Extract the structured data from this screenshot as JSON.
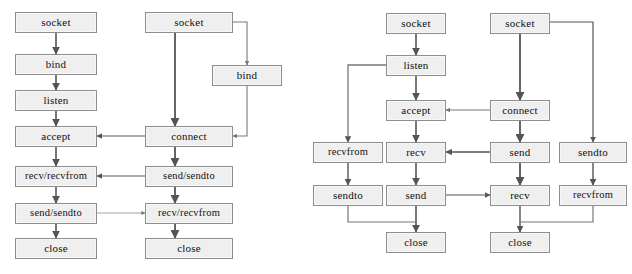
{
  "figure": {
    "style": {
      "node_fill": "#efefef",
      "node_border": "#8d8d8d",
      "edge_color": "#555555",
      "text_color": "#111111",
      "background": "#ffffff"
    }
  },
  "diagrams": [
    {
      "id": "tcp-stream-sockets",
      "name": "tcp-connection-oriented-diagram",
      "columns": [
        {
          "role": "server",
          "labels": [
            "socket",
            "bind",
            "listen",
            "accept",
            "recv/recvfrom",
            "send/sendto",
            "close"
          ]
        },
        {
          "role": "client",
          "labels": [
            "socket",
            "bind",
            "connect",
            "send/sendto",
            "recv/recvfrom",
            "close"
          ]
        }
      ],
      "nodes": [
        {
          "key": "l_srv_socket",
          "label": "socket",
          "x": 15,
          "y": 12,
          "w": 82,
          "h": 21
        },
        {
          "key": "l_srv_bind",
          "label": "bind",
          "x": 15,
          "y": 54,
          "w": 82,
          "h": 21
        },
        {
          "key": "l_srv_listen",
          "label": "listen",
          "x": 15,
          "y": 90,
          "w": 82,
          "h": 21
        },
        {
          "key": "l_srv_accept",
          "label": "accept",
          "x": 15,
          "y": 126,
          "w": 82,
          "h": 21
        },
        {
          "key": "l_srv_recv",
          "label": "recv/recvfrom",
          "x": 15,
          "y": 166,
          "w": 82,
          "h": 21
        },
        {
          "key": "l_srv_send",
          "label": "send/sendto",
          "x": 15,
          "y": 203,
          "w": 82,
          "h": 21
        },
        {
          "key": "l_srv_close",
          "label": "close",
          "x": 15,
          "y": 238,
          "w": 82,
          "h": 21
        },
        {
          "key": "l_cli_socket",
          "label": "socket",
          "x": 145,
          "y": 12,
          "w": 88,
          "h": 21
        },
        {
          "key": "l_cli_bind",
          "label": "bind",
          "x": 212,
          "y": 65,
          "w": 70,
          "h": 21
        },
        {
          "key": "l_cli_connect",
          "label": "connect",
          "x": 145,
          "y": 126,
          "w": 88,
          "h": 21
        },
        {
          "key": "l_cli_send",
          "label": "send/sendto",
          "x": 145,
          "y": 166,
          "w": 88,
          "h": 21
        },
        {
          "key": "l_cli_recv",
          "label": "recv/recvfrom",
          "x": 145,
          "y": 203,
          "w": 88,
          "h": 21
        },
        {
          "key": "l_cli_close",
          "label": "close",
          "x": 145,
          "y": 238,
          "w": 88,
          "h": 21
        }
      ],
      "edges": [
        {
          "from": "l_srv_socket",
          "to": "l_srv_bind",
          "kind": "vertical"
        },
        {
          "from": "l_srv_bind",
          "to": "l_srv_listen",
          "kind": "vertical"
        },
        {
          "from": "l_srv_listen",
          "to": "l_srv_accept",
          "kind": "vertical"
        },
        {
          "from": "l_srv_accept",
          "to": "l_srv_recv",
          "kind": "vertical"
        },
        {
          "from": "l_srv_recv",
          "to": "l_srv_send",
          "kind": "vertical"
        },
        {
          "from": "l_srv_send",
          "to": "l_srv_close",
          "kind": "vertical"
        },
        {
          "from": "l_cli_socket",
          "to": "l_cli_bind",
          "kind": "elbow-right-down"
        },
        {
          "from": "l_cli_socket",
          "to": "l_cli_connect",
          "kind": "vertical"
        },
        {
          "from": "l_cli_bind",
          "to": "l_cli_connect",
          "kind": "elbow-down-left"
        },
        {
          "from": "l_cli_connect",
          "to": "l_srv_accept",
          "kind": "horizontal-left"
        },
        {
          "from": "l_cli_connect",
          "to": "l_cli_send",
          "kind": "vertical"
        },
        {
          "from": "l_cli_send",
          "to": "l_srv_recv",
          "kind": "horizontal-left"
        },
        {
          "from": "l_cli_send",
          "to": "l_cli_recv",
          "kind": "vertical"
        },
        {
          "from": "l_srv_send",
          "to": "l_cli_recv",
          "kind": "horizontal-right"
        },
        {
          "from": "l_cli_recv",
          "to": "l_cli_close",
          "kind": "vertical"
        }
      ]
    },
    {
      "id": "udp-datagram-sockets",
      "name": "udp-connectionless-diagram",
      "columns": [
        {
          "role": "udp-server",
          "labels": [
            "recvfrom",
            "sendto",
            "close"
          ]
        },
        {
          "role": "tcp-server",
          "labels": [
            "socket",
            "listen",
            "accept",
            "recv",
            "send",
            "close"
          ]
        },
        {
          "role": "tcp-client",
          "labels": [
            "socket",
            "connect",
            "send",
            "recv",
            "close"
          ]
        },
        {
          "role": "udp-client",
          "labels": [
            "sendto",
            "recvfrom"
          ]
        }
      ],
      "nodes": [
        {
          "key": "r_c1_recvfrom",
          "label": "recvfrom",
          "x": 313,
          "y": 142,
          "w": 70,
          "h": 21
        },
        {
          "key": "r_c1_sendto",
          "label": "sendto",
          "x": 313,
          "y": 185,
          "w": 70,
          "h": 21
        },
        {
          "key": "r_c2_socket",
          "label": "socket",
          "x": 386,
          "y": 13,
          "w": 60,
          "h": 21
        },
        {
          "key": "r_c2_listen",
          "label": "listen",
          "x": 386,
          "y": 55,
          "w": 60,
          "h": 21
        },
        {
          "key": "r_c2_accept",
          "label": "accept",
          "x": 386,
          "y": 100,
          "w": 60,
          "h": 21
        },
        {
          "key": "r_c2_recv",
          "label": "recv",
          "x": 386,
          "y": 142,
          "w": 60,
          "h": 21
        },
        {
          "key": "r_c2_send",
          "label": "send",
          "x": 386,
          "y": 185,
          "w": 60,
          "h": 21
        },
        {
          "key": "r_c2_close",
          "label": "close",
          "x": 386,
          "y": 232,
          "w": 60,
          "h": 21
        },
        {
          "key": "r_c3_socket",
          "label": "socket",
          "x": 490,
          "y": 13,
          "w": 60,
          "h": 21
        },
        {
          "key": "r_c3_connect",
          "label": "connect",
          "x": 490,
          "y": 100,
          "w": 60,
          "h": 21
        },
        {
          "key": "r_c3_send",
          "label": "send",
          "x": 490,
          "y": 142,
          "w": 60,
          "h": 21
        },
        {
          "key": "r_c3_recv",
          "label": "recv",
          "x": 490,
          "y": 185,
          "w": 60,
          "h": 21
        },
        {
          "key": "r_c3_close",
          "label": "close",
          "x": 490,
          "y": 232,
          "w": 60,
          "h": 21
        },
        {
          "key": "r_c4_sendto",
          "label": "sendto",
          "x": 559,
          "y": 142,
          "w": 68,
          "h": 21
        },
        {
          "key": "r_c4_recvfrom",
          "label": "recvfrom",
          "x": 559,
          "y": 185,
          "w": 68,
          "h": 21
        }
      ],
      "edges": [
        {
          "from": "r_c2_socket",
          "to": "r_c2_listen",
          "kind": "vertical"
        },
        {
          "from": "r_c2_listen",
          "to": "r_c1_recvfrom",
          "kind": "elbow-left-down"
        },
        {
          "from": "r_c2_listen",
          "to": "r_c2_accept",
          "kind": "vertical"
        },
        {
          "from": "r_c2_accept",
          "to": "r_c2_recv",
          "kind": "vertical"
        },
        {
          "from": "r_c2_recv",
          "to": "r_c2_send",
          "kind": "vertical"
        },
        {
          "from": "r_c1_recvfrom",
          "to": "r_c1_sendto",
          "kind": "vertical"
        },
        {
          "from": "r_c1_sendto",
          "to": "r_c2_close",
          "kind": "elbow-down-right"
        },
        {
          "from": "r_c2_send",
          "to": "r_c2_close",
          "kind": "vertical"
        },
        {
          "from": "r_c2_send",
          "to": "r_c3_recv",
          "kind": "horizontal-right"
        },
        {
          "from": "r_c3_socket",
          "to": "r_c3_connect",
          "kind": "vertical"
        },
        {
          "from": "r_c3_socket",
          "to": "r_c4_sendto",
          "kind": "elbow-right-down"
        },
        {
          "from": "r_c3_connect",
          "to": "r_c2_accept",
          "kind": "horizontal-left"
        },
        {
          "from": "r_c3_connect",
          "to": "r_c3_send",
          "kind": "vertical"
        },
        {
          "from": "r_c3_send",
          "to": "r_c2_recv",
          "kind": "horizontal-left"
        },
        {
          "from": "r_c3_send",
          "to": "r_c3_recv",
          "kind": "vertical"
        },
        {
          "from": "r_c3_recv",
          "to": "r_c3_close",
          "kind": "vertical"
        },
        {
          "from": "r_c4_sendto",
          "to": "r_c4_recvfrom",
          "kind": "vertical"
        },
        {
          "from": "r_c4_recvfrom",
          "to": "r_c3_close",
          "kind": "elbow-down-left"
        }
      ]
    }
  ]
}
